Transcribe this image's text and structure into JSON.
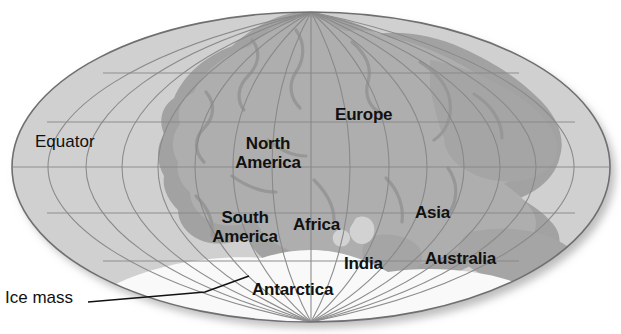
{
  "figure": {
    "kind": "world-map-pangaea",
    "projection": "mollweide-ellipse",
    "background_color": "#ffffff",
    "ocean_color": "#cfcfcf",
    "land_color": "#b0b0b0",
    "shelf_color": "#9a9a9a",
    "ice_color": "#ffffff",
    "graticule_color": "#8d8d8d",
    "outline_color": "#6f6f6f",
    "label_color": "#111111",
    "shadow_color": "#b9b9b9"
  },
  "map": {
    "ellipse": {
      "cx": 311,
      "cy": 167,
      "rx": 299,
      "ry": 155
    },
    "graticule": {
      "meridian_count": 13,
      "parallel_count": 5,
      "parallels_latitudes": [
        60,
        30,
        0,
        -30,
        -60
      ],
      "equator_y": 167
    }
  },
  "labels": {
    "equator": {
      "text": "Equator",
      "x": 35,
      "y": 142,
      "bold": false
    },
    "ice_mass": {
      "text": "Ice mass",
      "x": 5,
      "y": 295,
      "bold": false,
      "leader_line": {
        "from_x": 88,
        "from_y": 302,
        "mid_x": 205,
        "mid_y": 292,
        "to_x": 247,
        "to_y": 277
      }
    },
    "continents": [
      {
        "name": "europe",
        "text": "Europe",
        "x": 335,
        "y": 112,
        "lines": 1
      },
      {
        "name": "north-america",
        "text": "North\nAmerica",
        "x": 228,
        "y": 140,
        "lines": 2
      },
      {
        "name": "asia",
        "text": "Asia",
        "x": 415,
        "y": 210,
        "lines": 1
      },
      {
        "name": "south-america",
        "text": "South\nAmerica",
        "x": 200,
        "y": 214,
        "lines": 2
      },
      {
        "name": "africa",
        "text": "Africa",
        "x": 293,
        "y": 222,
        "lines": 1
      },
      {
        "name": "india",
        "text": "India",
        "x": 344,
        "y": 261,
        "lines": 1
      },
      {
        "name": "australia",
        "text": "Australia",
        "x": 425,
        "y": 256,
        "lines": 1
      },
      {
        "name": "antarctica",
        "text": "Antarctica",
        "x": 252,
        "y": 287,
        "lines": 1
      }
    ]
  }
}
